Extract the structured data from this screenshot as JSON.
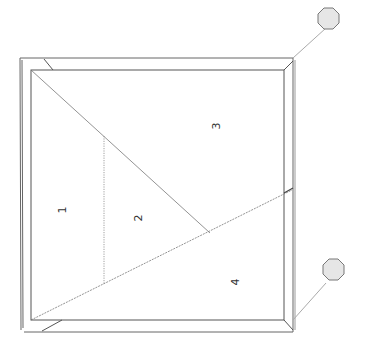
{
  "diagram": {
    "type": "panel-layout-plan",
    "regions": [
      {
        "id": "1",
        "label": "1"
      },
      {
        "id": "2",
        "label": "2"
      },
      {
        "id": "3",
        "label": "3"
      },
      {
        "id": "4",
        "label": "4"
      }
    ],
    "markers": [
      {
        "id": "marker-top",
        "shape": "octagon",
        "fill": "#e6e6e6"
      },
      {
        "id": "marker-bottom",
        "shape": "octagon",
        "fill": "#e6e6e6"
      }
    ],
    "colors": {
      "line": "#555555",
      "light_line": "#999999",
      "marker_fill": "#e6e6e6",
      "background": "#ffffff"
    }
  }
}
